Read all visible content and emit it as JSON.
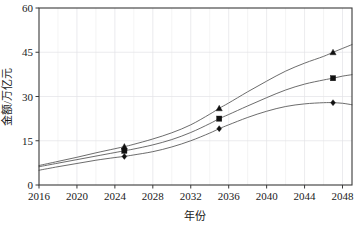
{
  "chart_data": {
    "type": "line",
    "title": "",
    "xlabel": "年份",
    "ylabel": "金额/万亿元",
    "xlim": [
      2016,
      2049
    ],
    "ylim": [
      0,
      60
    ],
    "xticks": [
      2016,
      2020,
      2024,
      2028,
      2032,
      2036,
      2040,
      2044,
      2048
    ],
    "yticks": [
      0,
      15,
      30,
      45,
      60
    ],
    "grid": true,
    "legend_position": "none",
    "series": [
      {
        "name": "上线",
        "marker": "triangle",
        "color": "#5b5b5b",
        "x": [
          2016,
          2018,
          2020,
          2022,
          2024,
          2025,
          2026,
          2028,
          2030,
          2032,
          2034,
          2035,
          2036,
          2038,
          2040,
          2042,
          2044,
          2046,
          2047,
          2048,
          2049
        ],
        "y": [
          6.6,
          8.0,
          9.4,
          10.9,
          12.3,
          13.0,
          13.8,
          15.6,
          17.7,
          20.4,
          24.0,
          26.0,
          27.8,
          31.6,
          35.2,
          38.6,
          41.3,
          43.6,
          45.0,
          46.3,
          47.6
        ],
        "markers": [
          {
            "x": 2025,
            "y": 13.0
          },
          {
            "x": 2035,
            "y": 26.0
          },
          {
            "x": 2047,
            "y": 45.0
          }
        ]
      },
      {
        "name": "中线",
        "marker": "square",
        "color": "#5b5b5b",
        "x": [
          2016,
          2018,
          2020,
          2022,
          2024,
          2025,
          2026,
          2028,
          2030,
          2032,
          2034,
          2035,
          2036,
          2038,
          2040,
          2042,
          2044,
          2046,
          2047,
          2048,
          2049
        ],
        "y": [
          6.2,
          7.4,
          8.6,
          9.8,
          11.0,
          11.6,
          12.2,
          13.6,
          15.4,
          17.8,
          20.8,
          22.5,
          23.9,
          26.8,
          29.6,
          32.2,
          34.2,
          35.6,
          36.2,
          36.9,
          37.4
        ],
        "markers": [
          {
            "x": 2025,
            "y": 11.6
          },
          {
            "x": 2035,
            "y": 22.5
          },
          {
            "x": 2047,
            "y": 36.2
          }
        ]
      },
      {
        "name": "下线",
        "marker": "diamond",
        "color": "#5b5b5b",
        "x": [
          2016,
          2018,
          2020,
          2022,
          2024,
          2025,
          2026,
          2028,
          2030,
          2032,
          2034,
          2035,
          2036,
          2038,
          2040,
          2042,
          2044,
          2046,
          2047,
          2048,
          2049
        ],
        "y": [
          5.0,
          6.2,
          7.3,
          8.4,
          9.3,
          9.7,
          10.2,
          11.3,
          12.9,
          15.0,
          17.6,
          19.1,
          20.4,
          22.9,
          25.0,
          26.6,
          27.5,
          27.9,
          27.9,
          27.7,
          27.2
        ],
        "markers": [
          {
            "x": 2025,
            "y": 9.7
          },
          {
            "x": 2035,
            "y": 19.1
          },
          {
            "x": 2047,
            "y": 27.9
          }
        ]
      }
    ]
  },
  "axes": {
    "x_tick_labels": [
      "2016",
      "2020",
      "2024",
      "2028",
      "2032",
      "2036",
      "2040",
      "2044",
      "2048"
    ],
    "y_tick_labels": [
      "0",
      "15",
      "30",
      "45",
      "60"
    ],
    "x_axis_title": "年份",
    "y_axis_title": "金额/万亿元"
  },
  "style": {
    "line_color": "#5b5b5b",
    "marker_color": "#111111",
    "grid_color": "#e3e3e6",
    "frame_color": "#3a3a3a",
    "background": "#ffffff"
  }
}
